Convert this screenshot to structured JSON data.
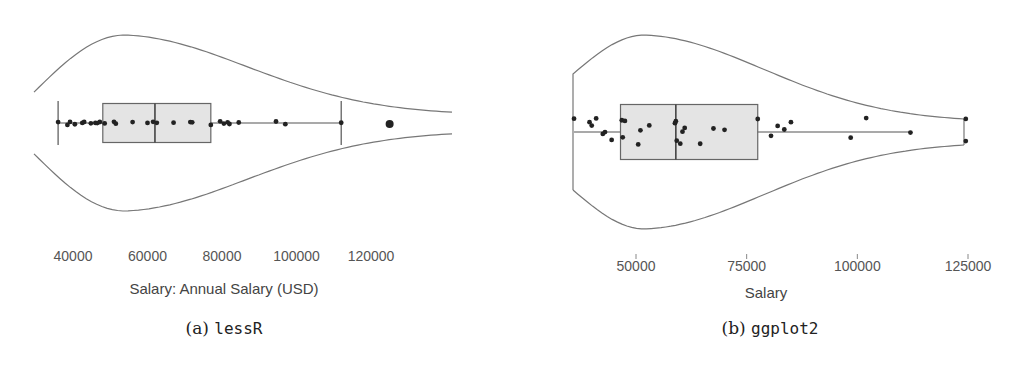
{
  "chart_data": [
    {
      "type": "violin+box+strip",
      "panel": "a",
      "caption_label": "(a)",
      "caption_pkg": "lessR",
      "xlabel": "Salary: Annual Salary (USD)",
      "ylabel": "",
      "xticks": [
        40000,
        60000,
        80000,
        100000,
        120000
      ],
      "xtick_labels": [
        "40000",
        "60000",
        "80000",
        "100000",
        "120000"
      ],
      "xlim": [
        33000,
        132000
      ],
      "grid": false,
      "box": {
        "q1": 48000,
        "median": 62000,
        "q3": 77000,
        "whisker_low": 36000,
        "whisker_high": 112000
      },
      "outliers": [
        125000
      ],
      "points": [
        36000,
        38500,
        39200,
        40500,
        42500,
        43000,
        44800,
        46000,
        46500,
        47200,
        48500,
        51000,
        51500,
        56000,
        60000,
        61500,
        62500,
        67000,
        71500,
        72000,
        77000,
        79500,
        80500,
        81500,
        82000,
        84500,
        94500,
        97000,
        112000,
        125000
      ]
    },
    {
      "type": "violin+box+strip",
      "panel": "b",
      "caption_label": "(b)",
      "caption_pkg": "ggplot2",
      "xlabel": "Salary",
      "ylabel": "",
      "xticks": [
        50000,
        75000,
        100000,
        125000
      ],
      "xtick_labels": [
        "50000",
        "75000",
        "100000",
        "125000"
      ],
      "xlim": [
        34000,
        126000
      ],
      "grid": false,
      "box": {
        "q1": 46500,
        "median": 59000,
        "q3": 77500,
        "whisker_low": 36000,
        "whisker_high": 112000
      },
      "outliers": [
        124500,
        124500
      ],
      "points": [
        36000,
        39500,
        40000,
        41000,
        42500,
        43000,
        44500,
        46800,
        47000,
        47500,
        50500,
        51000,
        53000,
        58800,
        59000,
        59200,
        60000,
        60500,
        61000,
        64500,
        67500,
        70000,
        77500,
        80500,
        82000,
        83500,
        85000,
        98500,
        102000,
        112000,
        124500,
        124500
      ]
    }
  ],
  "colors": {
    "violin_stroke": "#777777",
    "box_fill": "#e4e4e4",
    "box_stroke": "#666666",
    "point": "#222222",
    "whisker": "#555555"
  }
}
